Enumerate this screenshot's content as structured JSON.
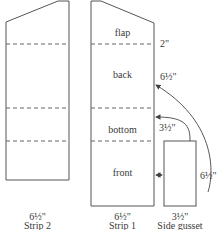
{
  "strips": [
    {
      "name": "Strip 2",
      "width_label": "6½\""
    },
    {
      "name": "Strip 1",
      "width_label": "6½\"",
      "sections": [
        "flap",
        "back",
        "bottom",
        "front"
      ],
      "dimensions": {
        "flap": "2\"",
        "back": "6½\"",
        "bottom": "3½\""
      }
    },
    {
      "name": "Side gusset",
      "width_label": "3½\"",
      "height_label": "6½\""
    }
  ],
  "colors": {
    "stroke": "#555555",
    "dash": "#666666",
    "text": "#3a3a3a"
  }
}
